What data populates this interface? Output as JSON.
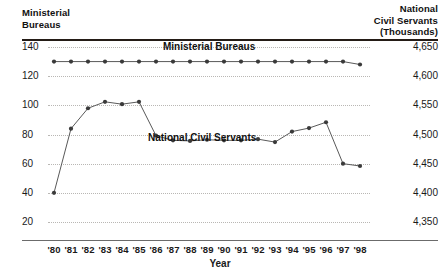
{
  "left_axis": {
    "header": "Ministerial\nBureaus",
    "ticks": [
      "140",
      "120",
      "100",
      "80",
      "60",
      "40",
      "20"
    ],
    "values": [
      140,
      120,
      100,
      80,
      60,
      40,
      20
    ]
  },
  "right_axis": {
    "header": "National\nCivil Servants\n(Thousands)",
    "ticks": [
      "4,650",
      "4,600",
      "4,550",
      "4,500",
      "4,450",
      "4,400",
      "4,350"
    ],
    "values": [
      4650,
      4600,
      4550,
      4500,
      4450,
      4400,
      4350
    ]
  },
  "x_axis": {
    "title": "Year",
    "ticks": [
      "'80",
      "'81",
      "'82",
      "'83",
      "'84",
      "'85",
      "'86",
      "'87",
      "'88",
      "'89",
      "'90",
      "'91",
      "'92",
      "'93",
      "'94",
      "'95",
      "'96",
      "'97",
      "'98"
    ]
  },
  "series_labels": {
    "ministerial": "Ministerial Bureaus",
    "ncs": "National Civil Servants"
  },
  "colors": {
    "line": "#595959",
    "marker": "#3a3a3a",
    "grid": "#b9b7b4",
    "rule": "#241c16",
    "text": "#1a1a1a"
  },
  "chart_data": {
    "type": "line",
    "title": "",
    "xlabel": "Year",
    "grid": true,
    "legend": "in-plot labels",
    "x": [
      "'80",
      "'81",
      "'82",
      "'83",
      "'84",
      "'85",
      "'86",
      "'87",
      "'88",
      "'89",
      "'90",
      "'91",
      "'92",
      "'93",
      "'94",
      "'95",
      "'96",
      "'97",
      "'98"
    ],
    "series": [
      {
        "name": "Ministerial Bureaus",
        "axis": "left",
        "ylabel": "Ministerial Bureaus",
        "ylim": [
          20,
          140
        ],
        "values": [
          130,
          130,
          130,
          130,
          130,
          130,
          130,
          130,
          130,
          130,
          130,
          130,
          130,
          130,
          130,
          130,
          130,
          130,
          128
        ]
      },
      {
        "name": "National Civil Servants",
        "axis": "right",
        "ylabel": "National Civil Servants (Thousands)",
        "ylim": [
          4350,
          4650
        ],
        "values": [
          4400,
          4510,
          4545,
          4556,
          4552,
          4556,
          4498,
          4490,
          4489,
          4491,
          4490,
          4490,
          4492,
          4487,
          4505,
          4511,
          4521,
          4450,
          4446
        ]
      }
    ]
  }
}
